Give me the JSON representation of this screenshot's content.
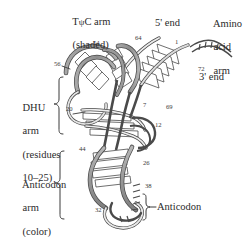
{
  "figure": {
    "background_color": "#ffffff",
    "ink_color": "#2b2b2b",
    "ribbon_shaded_color": "#9b9b9b",
    "ribbon_light_color": "#ffffff",
    "ribbon_outline_color": "#4a4a4a"
  },
  "labels": {
    "tpsic_arm": {
      "line1": "TψC arm",
      "line2": "(shaded)"
    },
    "five_prime_end": "5' end",
    "amino_acid_arm": {
      "line1": "Amino",
      "line2": "acid",
      "line3": "arm"
    },
    "three_prime_end": "3' end",
    "dhu_arm": {
      "line1": "DHU",
      "line2": "arm",
      "line3": "(residues",
      "line4": "10–25)"
    },
    "anticodon_arm": {
      "line1": "Anticodon",
      "line2": "arm",
      "line3": "(color)"
    },
    "anticodon": "Anticodon"
  },
  "residue_numbers": {
    "n54": "54",
    "n64": "64",
    "n1": "1",
    "n56": "56",
    "n72": "72",
    "n20": "20",
    "n7": "7",
    "n69": "69",
    "n12": "12",
    "n44": "44",
    "n26": "26",
    "n38": "38",
    "n32": "32"
  }
}
